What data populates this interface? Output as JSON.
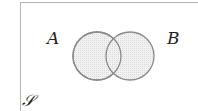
{
  "diagram": {
    "type": "venn",
    "universe_label": "𝒮",
    "sets": [
      {
        "label": "A",
        "cx": 97,
        "cy": 56,
        "r": 24
      },
      {
        "label": "B",
        "cx": 130,
        "cy": 56,
        "r": 24
      }
    ],
    "colors": {
      "fill": "#ececec",
      "stroke": "#8a8a8a",
      "border": "#b5b5b5",
      "text": "#222222"
    }
  }
}
